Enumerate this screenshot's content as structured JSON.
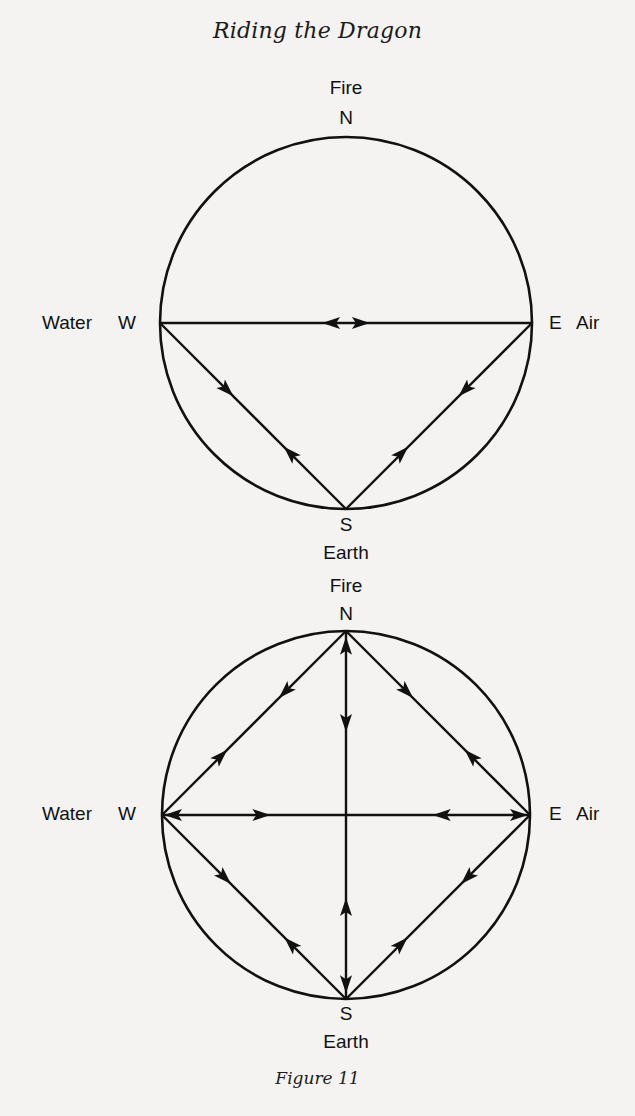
{
  "header": {
    "title": "Riding the Dragon"
  },
  "caption": "Figure 11",
  "diagrams": [
    {
      "id": "diagram-1",
      "description": "Compass circle with arrows flowing from Water and Air toward each other, and between Earth and Water/Air",
      "nodes": {
        "N": {
          "letter": "N",
          "element": "Fire"
        },
        "S": {
          "letter": "S",
          "element": "Earth"
        },
        "W": {
          "letter": "W",
          "element": "Water"
        },
        "E": {
          "letter": "E",
          "element": "Air"
        }
      },
      "edges": [
        {
          "from": "W",
          "to": "E",
          "arrows": [
            {
              "t": 0.54,
              "toward": "E"
            }
          ]
        },
        {
          "from": "E",
          "to": "W",
          "arrows": [
            {
              "t": 0.54,
              "toward": "W"
            }
          ],
          "segment": "same-line"
        },
        {
          "from": "W",
          "to": "S",
          "arrows": [
            {
              "t": 0.36,
              "toward": "S"
            },
            {
              "t": 0.7,
              "toward": "W"
            }
          ]
        },
        {
          "from": "E",
          "to": "S",
          "arrows": [
            {
              "t": 0.36,
              "toward": "S"
            },
            {
              "t": 0.7,
              "toward": "E"
            }
          ]
        }
      ]
    },
    {
      "id": "diagram-2",
      "description": "Compass circle with full diamond and cross of double-directional arrows",
      "nodes": {
        "N": {
          "letter": "N",
          "element": "Fire"
        },
        "S": {
          "letter": "S",
          "element": "Earth"
        },
        "W": {
          "letter": "W",
          "element": "Water"
        },
        "E": {
          "letter": "E",
          "element": "Air"
        }
      },
      "edges": [
        {
          "from": "N",
          "to": "W",
          "arrows": [
            {
              "t": 0.33,
              "toward": "W"
            },
            {
              "t": 0.68,
              "toward": "N"
            }
          ]
        },
        {
          "from": "N",
          "to": "E",
          "arrows": [
            {
              "t": 0.33,
              "toward": "E"
            },
            {
              "t": 0.68,
              "toward": "N"
            }
          ]
        },
        {
          "from": "W",
          "to": "S",
          "arrows": [
            {
              "t": 0.34,
              "toward": "S"
            },
            {
              "t": 0.7,
              "toward": "W"
            }
          ]
        },
        {
          "from": "E",
          "to": "S",
          "arrows": [
            {
              "t": 0.34,
              "toward": "S"
            },
            {
              "t": 0.7,
              "toward": "E"
            }
          ]
        },
        {
          "from": "W",
          "to": "E",
          "arrows": [
            {
              "t": 0.03,
              "toward": "W"
            },
            {
              "t": 0.27,
              "toward": "E"
            },
            {
              "t": 0.76,
              "toward": "W"
            },
            {
              "t": 0.97,
              "toward": "E"
            }
          ]
        },
        {
          "from": "N",
          "to": "S",
          "arrows": [
            {
              "t": 0.04,
              "toward": "N"
            },
            {
              "t": 0.25,
              "toward": "S"
            },
            {
              "t": 0.75,
              "toward": "N"
            },
            {
              "t": 0.96,
              "toward": "S"
            }
          ]
        }
      ]
    }
  ]
}
